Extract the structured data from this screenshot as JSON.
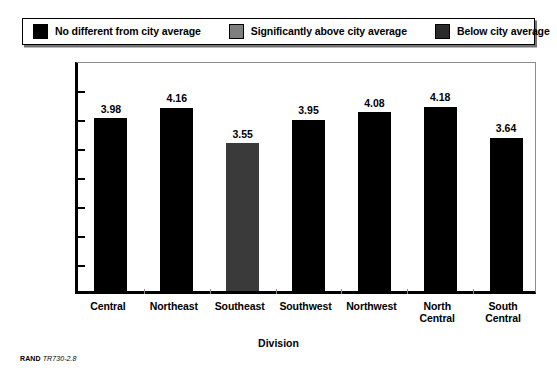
{
  "legend": {
    "items": [
      {
        "label": "No different from city average",
        "color": "#000000",
        "swatch_name": "legend-swatch-black"
      },
      {
        "label": "Significantly above city average",
        "color": "#7f7f7f",
        "swatch_name": "legend-swatch-gray"
      },
      {
        "label": "Below city average",
        "color": "#2b2b2b",
        "swatch_name": "legend-swatch-darkgray"
      }
    ]
  },
  "source": {
    "brand": "RAND",
    "id": "TR730-2.8"
  },
  "chart_data": {
    "type": "bar",
    "title": "",
    "xlabel": "Division",
    "ylabel": "Police professionalism composite scale",
    "categories": [
      "Central",
      "Northeast",
      "Southeast",
      "Southwest",
      "Northwest",
      "North Central",
      "South Central"
    ],
    "category_lines": [
      [
        "Central"
      ],
      [
        "Northeast"
      ],
      [
        "Southeast"
      ],
      [
        "Southwest"
      ],
      [
        "Northwest"
      ],
      [
        "North",
        "Central"
      ],
      [
        "South",
        "Central"
      ]
    ],
    "values": [
      3.98,
      4.16,
      3.55,
      3.95,
      4.08,
      4.18,
      3.64
    ],
    "value_labels": [
      "3.98",
      "4.16",
      "3.55",
      "3.95",
      "4.08",
      "4.18",
      "3.64"
    ],
    "bar_colors": [
      "#000000",
      "#000000",
      "#3a3a3a",
      "#000000",
      "#000000",
      "#000000",
      "#000000"
    ],
    "bar_categories": [
      "No different from city average",
      "No different from city average",
      "Below city average",
      "No different from city average",
      "No different from city average",
      "No different from city average",
      "No different from city average"
    ],
    "ylim": [
      1.0,
      5.0
    ],
    "ytick_values": [
      1.0,
      1.5,
      2.0,
      2.5,
      3.0,
      3.5,
      4.0,
      4.5,
      5.0
    ],
    "ytick_labels": [
      "1.0",
      "1.5",
      "2.0",
      "2.5",
      "3.0",
      "3.5",
      "4.0",
      "4.5",
      "5.0"
    ],
    "grid": false,
    "legend_position": "top"
  }
}
